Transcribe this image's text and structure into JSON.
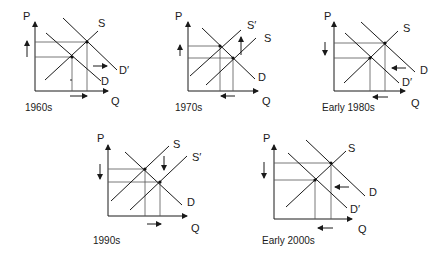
{
  "axis_labels": {
    "price": "P",
    "quantity": "Q"
  },
  "panels": [
    {
      "caption": "1960s",
      "curves": {
        "s": "S",
        "d": "D",
        "d_prime": "D′"
      },
      "shift": "demand-right",
      "price_change": "up",
      "quantity_change": "right"
    },
    {
      "caption": "1970s",
      "curves": {
        "s": "S",
        "s_prime": "S′",
        "d": "D"
      },
      "shift": "supply-left",
      "price_change": "up",
      "quantity_change": "left"
    },
    {
      "caption": "Early 1980s",
      "curves": {
        "s": "S",
        "d": "D",
        "d_prime": "D′"
      },
      "shift": "demand-left",
      "price_change": "down",
      "quantity_change": "left"
    },
    {
      "caption": "1990s",
      "curves": {
        "s": "S",
        "s_prime": "S′",
        "d": "D"
      },
      "shift": "supply-right",
      "price_change": "down",
      "quantity_change": "right"
    },
    {
      "caption": "Early 2000s",
      "curves": {
        "s": "S",
        "d": "D",
        "d_prime": "D′"
      },
      "shift": "demand-left",
      "price_change": "down",
      "quantity_change": "left"
    }
  ],
  "colors": {
    "ink": "#1a1a1a",
    "background": "#ffffff"
  }
}
